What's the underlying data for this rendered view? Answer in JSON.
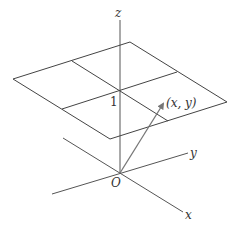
{
  "diagram": {
    "type": "3d-coordinate-axes-with-plane",
    "colors": {
      "lines": "#555555",
      "arrow": "#777777",
      "text": "#333333",
      "background": "#ffffff"
    },
    "axes": {
      "z_label": "z",
      "y_label": "y",
      "x_label": "x",
      "origin_label": "O"
    },
    "plane": {
      "height_label": "1",
      "point_label": "(x, y)"
    }
  }
}
